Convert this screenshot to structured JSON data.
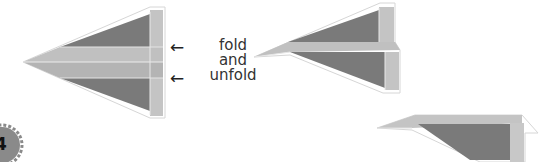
{
  "diagram": {
    "type": "paper-airplane-folding-step",
    "step_number": "4",
    "instruction_lines": [
      "fold",
      "and",
      "unfold"
    ],
    "arrows": [
      "left-arrow",
      "left-arrow"
    ],
    "colors": {
      "dark_panel": "#7a7a7a",
      "light_panel": "#c4c4c4",
      "mid_band": "#b8b8b8",
      "outline": "#d8d8d8",
      "badge": "#8a8a8a",
      "text": "#333333"
    }
  }
}
